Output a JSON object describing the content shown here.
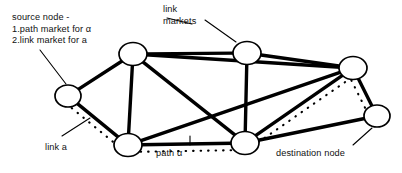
{
  "figure": {
    "background_color": "#ffffff",
    "ink_color": "#000000"
  },
  "annotations": [
    {
      "name": "source-node-label",
      "text": "source node -\n1.path market for α\n2.link market for a",
      "x": 12,
      "y": 12
    },
    {
      "name": "link-markets-label",
      "text": "link\nmarkets",
      "x": 163,
      "y": 4
    },
    {
      "name": "link-a-label",
      "text": "link a",
      "x": 45,
      "y": 142
    },
    {
      "name": "path-alpha-label",
      "text": "path α",
      "x": 156,
      "y": 148
    },
    {
      "name": "destination-node-label",
      "text": "destination node",
      "x": 276,
      "y": 148
    }
  ],
  "chart_data": {
    "type": "diagram",
    "nodes": [
      {
        "id": "n-left",
        "label": "source node",
        "x": 68,
        "y": 96,
        "rx": 13,
        "ry": 11
      },
      {
        "id": "n-top-left",
        "label": "",
        "x": 133,
        "y": 54,
        "rx": 14,
        "ry": 11.5
      },
      {
        "id": "n-top-mid",
        "label": "",
        "x": 247,
        "y": 53,
        "rx": 14,
        "ry": 11.5
      },
      {
        "id": "n-top-right",
        "label": "",
        "x": 353,
        "y": 68,
        "rx": 14,
        "ry": 11.5
      },
      {
        "id": "n-bottom-left",
        "label": "",
        "x": 128,
        "y": 145,
        "rx": 14,
        "ry": 11.5
      },
      {
        "id": "n-bottom-mid",
        "label": "",
        "x": 245,
        "y": 143,
        "rx": 14,
        "ry": 11.5
      },
      {
        "id": "n-right",
        "label": "destination node",
        "x": 377,
        "y": 116,
        "rx": 13,
        "ry": 11
      }
    ],
    "edges": [
      {
        "from": "n-left",
        "to": "n-top-left",
        "style": "solid"
      },
      {
        "from": "n-left",
        "to": "n-bottom-left",
        "style": "solid"
      },
      {
        "from": "n-top-left",
        "to": "n-top-mid",
        "style": "solid"
      },
      {
        "from": "n-top-left",
        "to": "n-bottom-left",
        "style": "solid"
      },
      {
        "from": "n-top-left",
        "to": "n-bottom-mid",
        "style": "solid"
      },
      {
        "from": "n-top-left",
        "to": "n-top-right",
        "style": "solid"
      },
      {
        "from": "n-top-mid",
        "to": "n-bottom-mid",
        "style": "solid"
      },
      {
        "from": "n-top-mid",
        "to": "n-top-right",
        "style": "solid"
      },
      {
        "from": "n-bottom-left",
        "to": "n-top-right",
        "style": "solid"
      },
      {
        "from": "n-bottom-left",
        "to": "n-bottom-mid",
        "style": "solid"
      },
      {
        "from": "n-bottom-mid",
        "to": "n-top-right",
        "style": "solid"
      },
      {
        "from": "n-bottom-mid",
        "to": "n-right",
        "style": "solid"
      },
      {
        "from": "n-top-right",
        "to": "n-right",
        "style": "solid"
      }
    ],
    "path_overlay": {
      "name": "path-alpha",
      "style": "dotted",
      "node_sequence": [
        "n-left",
        "n-bottom-left",
        "n-bottom-mid",
        "n-top-right",
        "n-right"
      ]
    },
    "leader_lines": [
      {
        "name": "leader-source-node",
        "x1": 40,
        "y1": 50,
        "x2": 66,
        "y2": 84
      },
      {
        "name": "leader-link-markets",
        "x1": 192,
        "y1": 24,
        "x2": 167,
        "y2": 18
      },
      {
        "name": "leader-link-markets-2",
        "x1": 205,
        "y1": 20,
        "x2": 236,
        "y2": 42
      },
      {
        "name": "leader-link-a",
        "x1": 62,
        "y1": 136,
        "x2": 90,
        "y2": 118
      },
      {
        "name": "leader-path-alpha",
        "x1": 190,
        "y1": 145,
        "x2": 190,
        "y2": 136
      },
      {
        "name": "leader-destination",
        "x1": 353,
        "y1": 145,
        "x2": 372,
        "y2": 128
      }
    ]
  }
}
